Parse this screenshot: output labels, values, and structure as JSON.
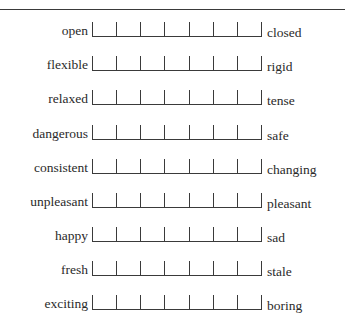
{
  "figure": {
    "type": "semantic-differential-scale",
    "points_per_scale": 7,
    "rows": [
      {
        "left": "open",
        "right": "closed"
      },
      {
        "left": "flexible",
        "right": "rigid"
      },
      {
        "left": "relaxed",
        "right": "tense"
      },
      {
        "left": "dangerous",
        "right": "safe"
      },
      {
        "left": "consistent",
        "right": "changing"
      },
      {
        "left": "unpleasant",
        "right": "pleasant"
      },
      {
        "left": "happy",
        "right": "sad"
      },
      {
        "left": "fresh",
        "right": "stale"
      },
      {
        "left": "exciting",
        "right": "boring"
      }
    ]
  }
}
